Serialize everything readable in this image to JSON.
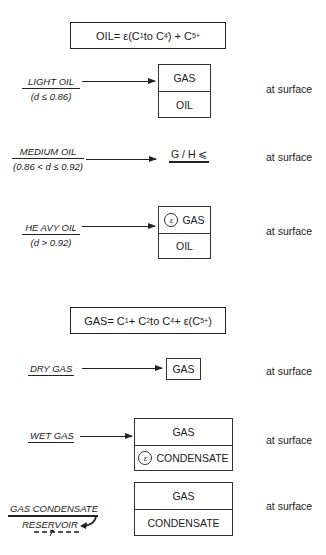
{
  "oil_section": {
    "formula": {
      "lhs": "OIL",
      "eq": " = ε(C",
      "s1": "1",
      "mid": " to C",
      "s2": "4",
      "rest": ") + C",
      "s3": "5",
      "sup": "+"
    },
    "rows": [
      {
        "name": "LIGHT OIL",
        "condition": "(d ≤ 0.86)",
        "result": [
          "GAS",
          "OIL"
        ],
        "location": "at surface"
      },
      {
        "name": "MEDIUM  OIL",
        "condition": "(0.86 < d ≤ 0.92)",
        "result_text": "G / H ⩽",
        "location": "at surface"
      },
      {
        "name": "HE AVY OIL",
        "condition": "(d > 0.92)",
        "result": [
          "GAS",
          "OIL"
        ],
        "epsilon": "ε",
        "location": "at surface"
      }
    ]
  },
  "gas_section": {
    "formula": {
      "lhs": "GAS",
      "eq": " = C",
      "s1": "1",
      "p1": " + C",
      "s2": "2",
      "mid": " to C",
      "s3": "4",
      "rest": " + ε(C",
      "s4": "5",
      "sup": "+",
      "end": ")"
    },
    "rows": [
      {
        "name": "DRY GAS",
        "result": [
          "GAS"
        ],
        "location": "at surface"
      },
      {
        "name": "WET GAS",
        "result": [
          "GAS",
          "CONDENSATE"
        ],
        "epsilon": "ε",
        "location": "at surface"
      },
      {
        "name": "GAS CONDENSATE",
        "sub": "RESERVOIR",
        "result": [
          "GAS",
          "CONDENSATE"
        ],
        "location": "at surface"
      }
    ]
  }
}
